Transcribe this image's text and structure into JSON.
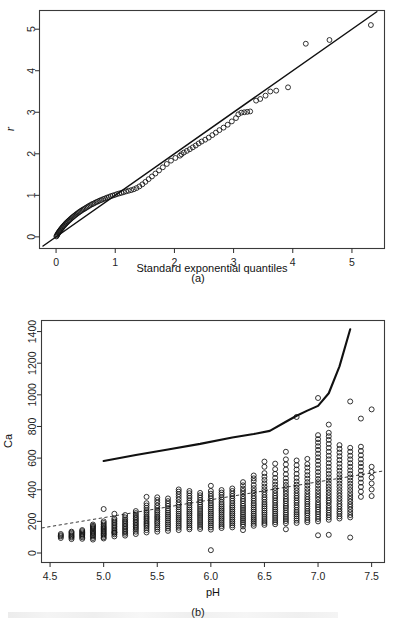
{
  "figure": {
    "panels": [
      {
        "tag": "(a)",
        "xlabel": "Standard exponential quantiles",
        "ylabel": "r"
      },
      {
        "tag": "(b)",
        "xlabel": "pH",
        "ylabel": "Ca"
      }
    ]
  },
  "chart_data": [
    {
      "type": "scatter",
      "title": "",
      "panel": "(a)",
      "xlabel": "Standard exponential quantiles",
      "ylabel": "r",
      "xlim": [
        -0.28,
        5.55
      ],
      "ylim": [
        -0.28,
        5.45
      ],
      "xticks": [
        0,
        1,
        2,
        3,
        4,
        5
      ],
      "yticks": [
        0,
        1,
        2,
        3,
        4,
        5
      ],
      "grid": false,
      "legend": "none",
      "marker": "open-circle",
      "reference_line": {
        "style": "solid",
        "description": "45-degree identity line",
        "x": [
          -0.22,
          5.42
        ],
        "y": [
          -0.22,
          5.42
        ]
      },
      "points": [
        [
          0.005,
          0.01
        ],
        [
          0.012,
          0.03
        ],
        [
          0.02,
          0.05
        ],
        [
          0.028,
          0.07
        ],
        [
          0.036,
          0.09
        ],
        [
          0.045,
          0.11
        ],
        [
          0.055,
          0.13
        ],
        [
          0.065,
          0.15
        ],
        [
          0.075,
          0.17
        ],
        [
          0.086,
          0.19
        ],
        [
          0.097,
          0.21
        ],
        [
          0.108,
          0.23
        ],
        [
          0.12,
          0.25
        ],
        [
          0.132,
          0.27
        ],
        [
          0.145,
          0.29
        ],
        [
          0.158,
          0.31
        ],
        [
          0.171,
          0.33
        ],
        [
          0.185,
          0.35
        ],
        [
          0.199,
          0.37
        ],
        [
          0.214,
          0.39
        ],
        [
          0.229,
          0.41
        ],
        [
          0.245,
          0.43
        ],
        [
          0.261,
          0.45
        ],
        [
          0.277,
          0.47
        ],
        [
          0.294,
          0.49
        ],
        [
          0.311,
          0.51
        ],
        [
          0.329,
          0.53
        ],
        [
          0.347,
          0.55
        ],
        [
          0.366,
          0.57
        ],
        [
          0.385,
          0.59
        ],
        [
          0.405,
          0.61
        ],
        [
          0.425,
          0.63
        ],
        [
          0.446,
          0.65
        ],
        [
          0.467,
          0.665
        ],
        [
          0.489,
          0.685
        ],
        [
          0.511,
          0.705
        ],
        [
          0.534,
          0.725
        ],
        [
          0.557,
          0.745
        ],
        [
          0.581,
          0.765
        ],
        [
          0.606,
          0.785
        ],
        [
          0.631,
          0.8
        ],
        [
          0.657,
          0.82
        ],
        [
          0.684,
          0.84
        ],
        [
          0.711,
          0.855
        ],
        [
          0.739,
          0.875
        ],
        [
          0.768,
          0.89
        ],
        [
          0.798,
          0.91
        ],
        [
          0.828,
          0.925
        ],
        [
          0.859,
          0.945
        ],
        [
          0.891,
          0.96
        ],
        [
          0.924,
          0.98
        ],
        [
          0.958,
          0.995
        ],
        [
          0.993,
          1.01
        ],
        [
          1.029,
          1.03
        ],
        [
          1.066,
          1.045
        ],
        [
          1.104,
          1.06
        ],
        [
          1.143,
          1.075
        ],
        [
          1.184,
          1.095
        ],
        [
          1.226,
          1.11
        ],
        [
          1.269,
          1.125
        ],
        [
          1.314,
          1.145
        ],
        [
          1.36,
          1.175
        ],
        [
          1.408,
          1.215
        ],
        [
          1.458,
          1.265
        ],
        [
          1.51,
          1.325
        ],
        [
          1.564,
          1.39
        ],
        [
          1.62,
          1.455
        ],
        [
          1.679,
          1.525
        ],
        [
          1.74,
          1.6
        ],
        [
          1.804,
          1.675
        ],
        [
          1.871,
          1.755
        ],
        [
          1.942,
          1.835
        ],
        [
          2.016,
          1.9
        ],
        [
          2.094,
          1.955
        ],
        [
          2.12,
          1.99
        ],
        [
          2.16,
          2.03
        ],
        [
          2.21,
          2.07
        ],
        [
          2.26,
          2.11
        ],
        [
          2.31,
          2.155
        ],
        [
          2.36,
          2.2
        ],
        [
          2.41,
          2.25
        ],
        [
          2.46,
          2.295
        ],
        [
          2.52,
          2.34
        ],
        [
          2.58,
          2.39
        ],
        [
          2.64,
          2.45
        ],
        [
          2.7,
          2.51
        ],
        [
          2.76,
          2.57
        ],
        [
          2.83,
          2.63
        ],
        [
          2.9,
          2.7
        ],
        [
          2.97,
          2.78
        ],
        [
          3.04,
          2.86
        ],
        [
          3.08,
          2.95
        ],
        [
          3.13,
          2.99
        ],
        [
          3.18,
          3.0
        ],
        [
          3.23,
          3.01
        ],
        [
          3.28,
          3.02
        ],
        [
          3.38,
          3.28
        ],
        [
          3.45,
          3.32
        ],
        [
          3.54,
          3.4
        ],
        [
          3.62,
          3.5
        ],
        [
          3.72,
          3.52
        ],
        [
          3.92,
          3.6
        ],
        [
          4.22,
          4.65
        ],
        [
          4.62,
          4.74
        ],
        [
          5.32,
          5.1
        ]
      ]
    },
    {
      "type": "scatter",
      "title": "",
      "panel": "(b)",
      "xlabel": "pH",
      "ylabel": "Ca",
      "xlim": [
        4.42,
        7.62
      ],
      "ylim": [
        -60,
        1470
      ],
      "xticks": [
        4.5,
        5.0,
        5.5,
        6.0,
        6.5,
        7.0,
        7.5
      ],
      "yticks": [
        0,
        200,
        400,
        600,
        800,
        1000,
        1200,
        1400
      ],
      "grid": false,
      "legend": "none",
      "marker": "open-circle",
      "trend_line": {
        "style": "dashed",
        "description": "linear fit of Ca on pH",
        "x": [
          4.42,
          7.62
        ],
        "y": [
          158,
          520
        ]
      },
      "upper_curve": {
        "style": "solid",
        "description": "upper quantile / saturation curve",
        "x": [
          5.0,
          5.3,
          5.6,
          5.9,
          6.2,
          6.4,
          6.55,
          6.7,
          6.8,
          6.9,
          7.0,
          7.1,
          7.2,
          7.3
        ],
        "y": [
          582,
          620,
          655,
          690,
          730,
          752,
          772,
          830,
          868,
          900,
          930,
          1010,
          1180,
          1415
        ]
      },
      "columns": [
        {
          "ph": 4.6,
          "values": [
            95,
            105,
            112,
            120
          ]
        },
        {
          "ph": 4.7,
          "values": [
            88,
            98,
            105,
            112,
            120,
            128,
            135
          ]
        },
        {
          "ph": 4.8,
          "values": [
            90,
            100,
            108,
            115,
            122,
            130,
            138,
            145
          ]
        },
        {
          "ph": 4.9,
          "values": [
            85,
            95,
            105,
            112,
            120,
            128,
            135,
            142,
            150,
            158,
            165,
            172,
            180
          ]
        },
        {
          "ph": 5.0,
          "values": [
            92,
            100,
            110,
            118,
            125,
            133,
            140,
            148,
            155,
            163,
            170,
            180,
            190,
            200,
            278
          ]
        },
        {
          "ph": 5.1,
          "values": [
            105,
            118,
            128,
            138,
            148,
            158,
            168,
            178,
            188,
            198,
            208,
            218,
            130,
            248
          ]
        },
        {
          "ph": 5.2,
          "values": [
            110,
            122,
            132,
            142,
            152,
            162,
            172,
            182,
            192,
            202,
            212,
            225,
            240
          ]
        },
        {
          "ph": 5.3,
          "values": [
            120,
            135,
            148,
            158,
            168,
            178,
            188,
            198,
            208,
            218,
            228,
            240,
            252,
            265
          ]
        },
        {
          "ph": 5.4,
          "values": [
            130,
            145,
            158,
            170,
            180,
            190,
            200,
            212,
            222,
            232,
            245,
            258,
            270,
            285,
            300,
            315,
            355
          ]
        },
        {
          "ph": 5.5,
          "values": [
            135,
            150,
            162,
            175,
            188,
            198,
            210,
            222,
            232,
            245,
            258,
            270,
            285,
            300,
            318,
            335,
            352
          ]
        },
        {
          "ph": 5.6,
          "values": [
            140,
            155,
            168,
            180,
            192,
            205,
            218,
            230,
            242,
            255,
            268,
            282,
            298,
            312,
            328,
            345
          ]
        },
        {
          "ph": 5.7,
          "values": [
            145,
            160,
            172,
            185,
            198,
            210,
            222,
            235,
            248,
            262,
            275,
            290,
            305,
            320,
            338,
            355,
            372,
            388,
            402
          ]
        },
        {
          "ph": 5.8,
          "values": [
            150,
            162,
            175,
            188,
            200,
            212,
            225,
            238,
            250,
            262,
            275,
            288,
            302,
            318,
            332,
            348,
            362,
            378,
            392
          ]
        },
        {
          "ph": 5.9,
          "values": [
            152,
            165,
            178,
            190,
            202,
            215,
            228,
            240,
            252,
            265,
            278,
            292,
            305,
            320,
            335,
            350,
            365,
            380
          ]
        },
        {
          "ph": 6.0,
          "values": [
            18,
            148,
            162,
            175,
            188,
            200,
            212,
            225,
            238,
            250,
            262,
            275,
            288,
            302,
            315,
            330,
            345,
            360,
            375,
            392,
            425
          ]
        },
        {
          "ph": 6.1,
          "values": [
            158,
            170,
            182,
            195,
            208,
            220,
            232,
            245,
            258,
            270,
            282,
            295,
            308,
            322,
            338,
            352,
            368,
            382,
            398
          ]
        },
        {
          "ph": 6.2,
          "values": [
            162,
            175,
            188,
            200,
            212,
            225,
            238,
            250,
            262,
            275,
            288,
            300,
            315,
            330,
            345,
            360,
            375,
            392,
            408
          ]
        },
        {
          "ph": 6.3,
          "values": [
            145,
            168,
            182,
            195,
            208,
            220,
            232,
            245,
            258,
            272,
            285,
            298,
            312,
            328,
            342,
            358,
            375,
            392,
            408,
            428,
            448
          ]
        },
        {
          "ph": 6.4,
          "values": [
            172,
            185,
            198,
            210,
            222,
            235,
            248,
            262,
            275,
            288,
            302,
            315,
            330,
            345,
            360,
            378,
            392,
            410,
            430,
            455,
            472,
            490
          ]
        },
        {
          "ph": 6.5,
          "values": [
            178,
            190,
            202,
            215,
            228,
            242,
            255,
            268,
            282,
            295,
            308,
            322,
            338,
            352,
            368,
            385,
            402,
            420,
            440,
            462,
            482,
            505,
            545,
            578
          ]
        },
        {
          "ph": 6.6,
          "values": [
            182,
            195,
            208,
            222,
            235,
            248,
            262,
            275,
            288,
            302,
            318,
            332,
            348,
            362,
            378,
            395,
            412,
            432,
            452,
            475,
            500,
            530,
            565
          ]
        },
        {
          "ph": 6.7,
          "values": [
            150,
            188,
            202,
            215,
            228,
            242,
            255,
            270,
            285,
            298,
            312,
            328,
            342,
            358,
            375,
            392,
            410,
            430,
            450,
            472,
            498,
            528,
            560,
            592,
            640
          ]
        },
        {
          "ph": 6.8,
          "values": [
            190,
            205,
            218,
            232,
            245,
            258,
            272,
            288,
            302,
            318,
            332,
            348,
            362,
            378,
            395,
            412,
            432,
            452,
            475,
            500,
            528,
            555,
            585,
            860
          ]
        },
        {
          "ph": 6.9,
          "values": [
            195,
            208,
            222,
            238,
            252,
            265,
            280,
            295,
            310,
            325,
            340,
            355,
            372,
            390,
            408,
            428,
            448,
            470,
            492,
            515,
            540,
            562,
            595
          ]
        },
        {
          "ph": 7.0,
          "values": [
            112,
            200,
            215,
            230,
            245,
            260,
            275,
            290,
            305,
            320,
            338,
            355,
            372,
            390,
            408,
            428,
            448,
            468,
            490,
            512,
            535,
            558,
            582,
            605,
            628,
            652,
            675,
            698,
            720,
            745,
            980
          ]
        },
        {
          "ph": 7.1,
          "values": [
            115,
            210,
            225,
            240,
            255,
            270,
            285,
            300,
            318,
            332,
            348,
            365,
            382,
            400,
            418,
            438,
            458,
            478,
            500,
            522,
            545,
            568,
            592,
            615,
            640,
            665,
            690,
            715,
            738,
            760,
            812
          ]
        },
        {
          "ph": 7.2,
          "values": [
            218,
            232,
            248,
            262,
            278,
            295,
            310,
            328,
            345,
            362,
            380,
            398,
            418,
            438,
            458,
            478,
            498,
            520,
            542,
            565,
            588,
            612,
            635,
            658,
            682
          ]
        },
        {
          "ph": 7.3,
          "values": [
            98,
            225,
            240,
            258,
            275,
            292,
            308,
            325,
            342,
            360,
            378,
            398,
            418,
            438,
            458,
            478,
            500,
            522,
            545,
            568,
            592,
            615,
            640,
            665,
            958
          ]
        },
        {
          "ph": 7.4,
          "values": [
            355,
            388,
            418,
            445,
            470,
            495,
            520,
            545,
            568,
            592,
            618,
            645,
            672,
            850
          ]
        },
        {
          "ph": 7.5,
          "values": [
            360,
            402,
            440,
            478,
            512,
            545,
            908
          ]
        }
      ]
    }
  ]
}
